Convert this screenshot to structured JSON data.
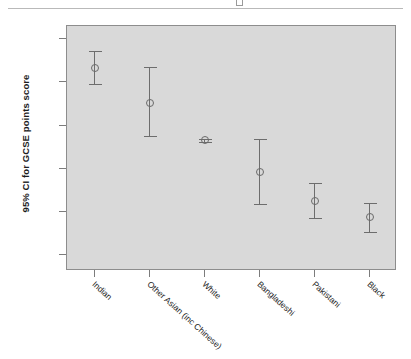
{
  "figure": {
    "top_rule": true,
    "top_glyph_icon": "cropped-glyph-icon"
  },
  "chart_data": {
    "type": "scatter",
    "title": "",
    "subtitle": "",
    "xlabel": "",
    "ylabel": "95% CI for GCSE points score",
    "ylim": [
      28.2,
      56.5
    ],
    "yticks": [
      30.0,
      35.0,
      40.0,
      45.0,
      50.0,
      55.0
    ],
    "ytick_labels": [
      "30.0",
      "35.0",
      "40.0",
      "45.0",
      "50.0",
      "55.0"
    ],
    "grid": false,
    "legend": "none",
    "error_bar_type": "95% confidence interval",
    "categories": [
      "Indian",
      "Other Asian (inc Chinese)",
      "White",
      "Bangladeshi",
      "Pakistani",
      "Black"
    ],
    "values": [
      51.7,
      47.6,
      43.3,
      39.6,
      36.3,
      34.4
    ],
    "ci_lower": [
      49.8,
      43.8,
      43.1,
      35.9,
      34.3,
      32.7
    ],
    "ci_upper": [
      53.6,
      51.8,
      43.5,
      43.4,
      38.4,
      36.1
    ],
    "points": [
      {
        "category": "Indian",
        "mean": 51.7,
        "lower": 49.8,
        "upper": 53.6
      },
      {
        "category": "Other Asian (inc Chinese)",
        "mean": 47.6,
        "lower": 43.8,
        "upper": 51.8
      },
      {
        "category": "White",
        "mean": 43.3,
        "lower": 43.1,
        "upper": 43.5
      },
      {
        "category": "Bangladeshi",
        "mean": 39.6,
        "lower": 35.9,
        "upper": 43.4
      },
      {
        "category": "Pakistani",
        "mean": 36.3,
        "lower": 34.3,
        "upper": 38.4
      },
      {
        "category": "Black",
        "mean": 34.4,
        "lower": 32.7,
        "upper": 36.1
      }
    ]
  },
  "colors": {
    "panel_background": "#d9d9d9",
    "panel_border": "#8d8d8d",
    "marker": "#6a6a6a",
    "whisker": "#6d6d6d",
    "text": "#1d1d1d",
    "rule": "#b9b9b9",
    "page_background": "#ffffff"
  }
}
